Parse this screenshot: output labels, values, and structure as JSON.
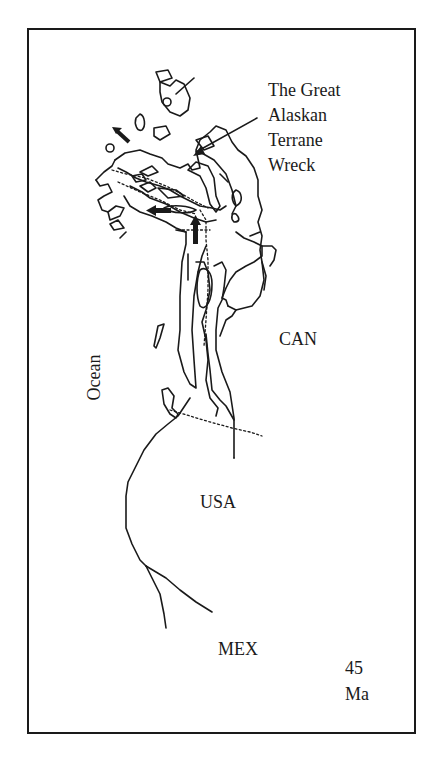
{
  "figure": {
    "callout": {
      "lines": [
        "The Great",
        "Alaskan",
        "Terrane",
        "Wreck"
      ]
    },
    "regions": {
      "canada": "CAN",
      "usa": "USA",
      "mexico": "MEX",
      "ocean": "Ocean"
    },
    "age": {
      "value": "45",
      "unit": "Ma"
    },
    "colors": {
      "ink": "#1a1a1a",
      "background": "#ffffff"
    },
    "arrows": [
      {
        "name": "northwest-motion-arrow",
        "direction": "northwest"
      },
      {
        "name": "west-motion-arrow",
        "direction": "west"
      },
      {
        "name": "north-motion-arrow",
        "direction": "north"
      },
      {
        "name": "callout-pointer-arrow",
        "direction": "southwest"
      }
    ]
  }
}
